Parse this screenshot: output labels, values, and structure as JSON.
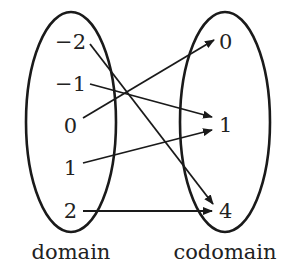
{
  "diagram": {
    "type": "function-mapping",
    "domain": {
      "caption": "domain",
      "elements": [
        "−2",
        "−1",
        "0",
        "1",
        "2"
      ]
    },
    "codomain": {
      "caption": "codomain",
      "elements": [
        "0",
        "1",
        "4"
      ]
    },
    "mappings": [
      {
        "from": "-2",
        "to": "4"
      },
      {
        "from": "-1",
        "to": "1"
      },
      {
        "from": "0",
        "to": "0"
      },
      {
        "from": "1",
        "to": "1"
      },
      {
        "from": "2",
        "to": "4"
      }
    ],
    "colors": {
      "stroke": "#1a1a1a",
      "text": "#222222",
      "background": "#ffffff"
    }
  }
}
